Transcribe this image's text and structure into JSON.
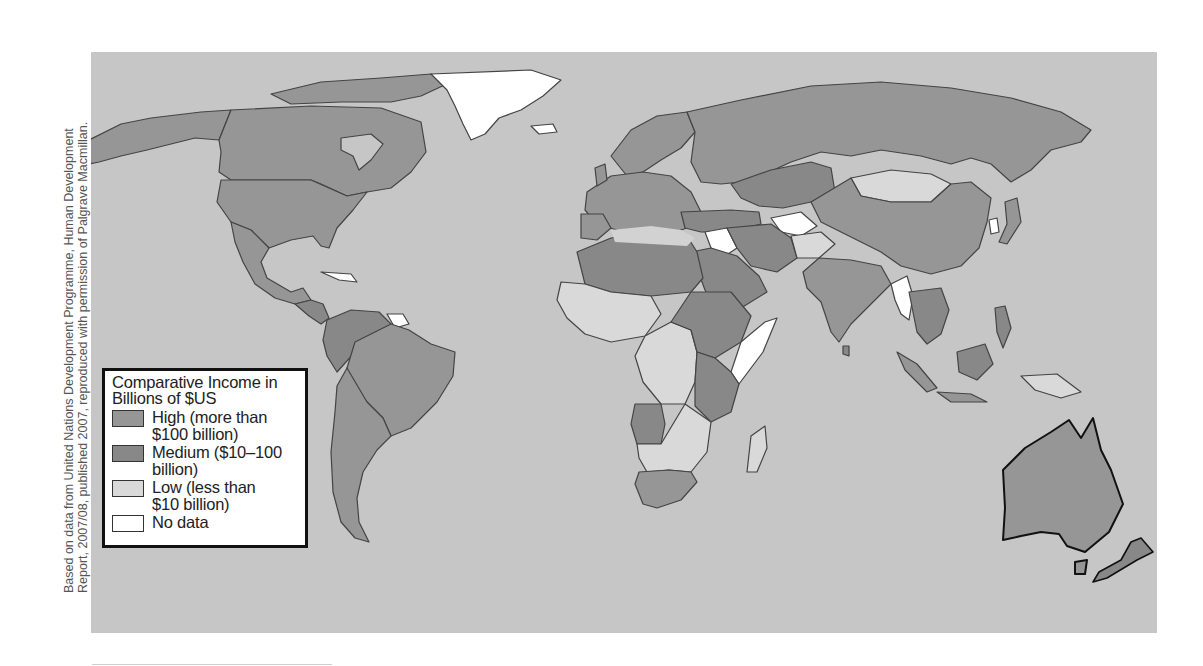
{
  "source_note": {
    "line1": "Based on data from United Nations Development Programme, Human Development",
    "line2": "Report, 2007/08, published 2007, reproduced with permission of Palgrave Macmillan."
  },
  "colors": {
    "ocean": "#c6c6c6",
    "high": "#969696",
    "medium": "#888888",
    "low": "#d9d9d9",
    "no_data": "#ffffff",
    "border": "#444444"
  },
  "legend": {
    "title": "Comparative Income in Billions of $US",
    "title_line1": "Comparative Income in",
    "title_line2": "Billions of $US",
    "items": [
      {
        "key": "high",
        "line1": "High (more than",
        "line2": "$100 billion)",
        "color": "#969696"
      },
      {
        "key": "medium",
        "line1": "Medium ($10–100",
        "line2": "billion)",
        "color": "#888888"
      },
      {
        "key": "low",
        "line1": "Low (less than",
        "line2": "$10 billion)",
        "color": "#d9d9d9"
      },
      {
        "key": "no_data",
        "line1": "No data",
        "line2": "",
        "color": "#ffffff"
      }
    ]
  },
  "regions": [
    {
      "name": "Alaska/USA",
      "category": "high"
    },
    {
      "name": "Canada",
      "category": "high"
    },
    {
      "name": "United States",
      "category": "high"
    },
    {
      "name": "Mexico",
      "category": "high"
    },
    {
      "name": "Greenland",
      "category": "no_data"
    },
    {
      "name": "Cuba",
      "category": "no_data"
    },
    {
      "name": "Guyana/Suriname",
      "category": "no_data"
    },
    {
      "name": "Brazil",
      "category": "high"
    },
    {
      "name": "Argentina",
      "category": "high"
    },
    {
      "name": "Russia",
      "category": "high"
    },
    {
      "name": "China",
      "category": "high"
    },
    {
      "name": "India",
      "category": "high"
    },
    {
      "name": "Mongolia",
      "category": "low"
    },
    {
      "name": "Afghanistan",
      "category": "low"
    },
    {
      "name": "Iraq",
      "category": "no_data"
    },
    {
      "name": "Turkmenistan/Uzbekistan",
      "category": "no_data"
    },
    {
      "name": "Myanmar",
      "category": "no_data"
    },
    {
      "name": "North Korea",
      "category": "no_data"
    },
    {
      "name": "Somalia",
      "category": "no_data"
    },
    {
      "name": "Australia",
      "category": "high"
    },
    {
      "name": "New Zealand",
      "category": "medium"
    },
    {
      "name": "South Africa",
      "category": "high"
    },
    {
      "name": "Madagascar",
      "category": "low"
    },
    {
      "name": "Sahel / Central Africa",
      "category": "low"
    },
    {
      "name": "Northern Africa",
      "category": "medium"
    },
    {
      "name": "Indonesia",
      "category": "high"
    }
  ]
}
